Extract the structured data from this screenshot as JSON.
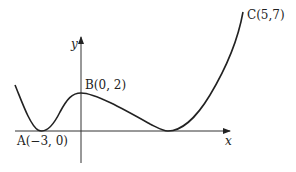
{
  "diagram": {
    "type": "function-graph",
    "axes": {
      "x_label": "x",
      "y_label": "y"
    },
    "points": [
      {
        "id": "A",
        "label": "A(−3, 0)",
        "x": -3,
        "y": 0
      },
      {
        "id": "B",
        "label": "B(0, 2)",
        "x": 0,
        "y": 2
      },
      {
        "id": "C",
        "label": "C(5,7)",
        "x": 5,
        "y": 7
      }
    ],
    "colors": {
      "curve": "#222222",
      "axis": "#333333"
    }
  }
}
